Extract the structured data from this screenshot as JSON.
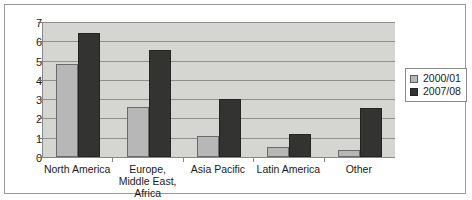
{
  "chart_data": {
    "type": "bar",
    "title": "",
    "xlabel": "",
    "ylabel": "",
    "ylim": [
      0,
      7
    ],
    "y_ticks": [
      0,
      1,
      2,
      3,
      4,
      5,
      6,
      7
    ],
    "grid": true,
    "legend_position": "right",
    "categories": [
      "North America",
      "Europe, Middle East, Africa",
      "Asia Pacific",
      "Latin America",
      "Other"
    ],
    "series": [
      {
        "name": "2000/01",
        "color": "#b7b7b7",
        "values": [
          4.8,
          2.6,
          1.1,
          0.5,
          0.35
        ]
      },
      {
        "name": "2007/08",
        "color": "#333331",
        "values": [
          6.45,
          5.55,
          3.0,
          1.2,
          2.55
        ]
      }
    ]
  },
  "colors": {
    "plot_background": "#d5d5d1",
    "gridline": "#8e8e8e",
    "axis": "#888888",
    "frame_border": "#9a9a9a",
    "series_2000_01": "#b7b7b7",
    "series_2007_08": "#333331"
  }
}
